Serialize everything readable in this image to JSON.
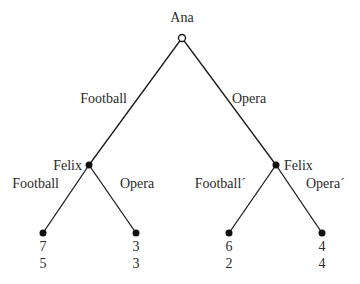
{
  "diagram": {
    "type": "extensive-form game tree",
    "root": {
      "player": "Ana",
      "node_style": "open"
    },
    "first_moves": [
      {
        "action": "Football",
        "to": "felix_left"
      },
      {
        "action": "Opera",
        "to": "felix_right"
      }
    ],
    "felix_left": {
      "player": "Felix",
      "node_style": "filled",
      "moves": [
        {
          "action": "Football",
          "payoffs": [
            "7",
            "5"
          ]
        },
        {
          "action": "Opera",
          "payoffs": [
            "3",
            "3"
          ]
        }
      ]
    },
    "felix_right": {
      "player": "Felix",
      "node_style": "filled",
      "moves": [
        {
          "action": "Football´",
          "payoffs": [
            "6",
            "2"
          ]
        },
        {
          "action": "Opera´",
          "payoffs": [
            "4",
            "4"
          ]
        }
      ]
    }
  }
}
